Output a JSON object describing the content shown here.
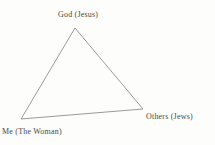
{
  "diagram": {
    "type": "triangle-relationship",
    "triangle": {
      "points": "75,28 21,119 143,109"
    },
    "nodes": [
      {
        "id": "top",
        "label": "God (Jesus)"
      },
      {
        "id": "right",
        "label": "Others (Jews)"
      },
      {
        "id": "bottom-left",
        "label": "Me (The Woman)"
      }
    ]
  },
  "colors": {
    "background": "#fdfdfc",
    "line": "#8f8f8f",
    "text": "#4c483f"
  }
}
